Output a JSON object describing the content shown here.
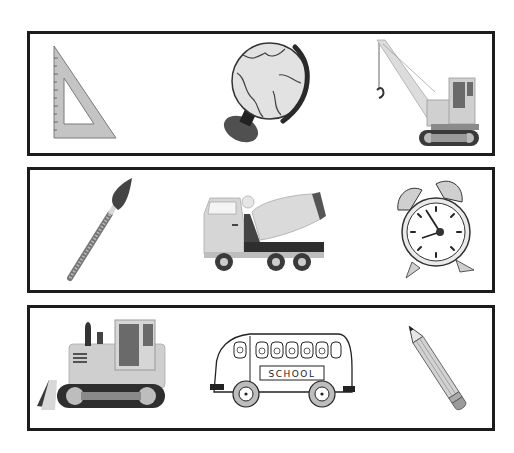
{
  "worksheet": {
    "rows": [
      {
        "items": [
          {
            "name": "Set square (triangle ruler)",
            "icon": "set-square-icon"
          },
          {
            "name": "Globe",
            "icon": "globe-icon"
          },
          {
            "name": "Crawler crane",
            "icon": "crane-icon"
          }
        ]
      },
      {
        "items": [
          {
            "name": "Paintbrush",
            "icon": "paintbrush-icon"
          },
          {
            "name": "Cement mixer truck",
            "icon": "cement-mixer-icon"
          },
          {
            "name": "Alarm clock",
            "icon": "alarm-clock-icon"
          }
        ]
      },
      {
        "items": [
          {
            "name": "Bulldozer",
            "icon": "bulldozer-icon"
          },
          {
            "name": "School bus",
            "icon": "school-bus-icon",
            "sign_text": "SCHOOL"
          },
          {
            "name": "Pencil",
            "icon": "pencil-icon"
          }
        ]
      }
    ]
  },
  "colors": {
    "border": "#1c1c1c",
    "background": "#ffffff",
    "light_gray": "#d9d9d9",
    "mid_gray": "#9a9a9a",
    "dark_gray": "#3a3a3a"
  }
}
